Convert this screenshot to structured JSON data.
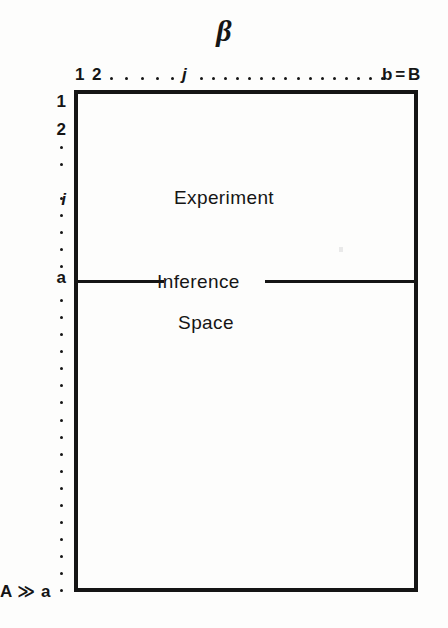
{
  "figure": {
    "column_axis_symbol": "β",
    "columns": {
      "first": "1",
      "second": "2",
      "generic": "j",
      "last": "b = B",
      "ellipsis_dots_run_1": 5,
      "ellipsis_dots_run_2": 16
    },
    "rows": {
      "first": "1",
      "second": "2",
      "generic": "i",
      "boundary": "a",
      "limit": "A ≫ a",
      "dot_count": 27
    },
    "regions": {
      "upper": "Experiment",
      "divider": "Inference",
      "lower": "Space"
    },
    "colors": {
      "ink": "#151515",
      "paper": "#fdfdfc"
    }
  }
}
